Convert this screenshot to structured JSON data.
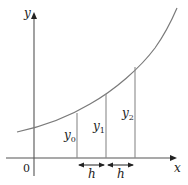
{
  "diagram": {
    "axes": {
      "x_label": "x",
      "y_label": "y",
      "origin_label": "0"
    },
    "ordinates": [
      {
        "label": "y",
        "subscript": "0"
      },
      {
        "label": "y",
        "subscript": "1"
      },
      {
        "label": "y",
        "subscript": "2"
      }
    ],
    "intervals": [
      {
        "label": "h"
      },
      {
        "label": "h"
      }
    ],
    "colors": {
      "axis": "#333333",
      "curve": "#7a7a7a",
      "ordinate": "#8a8a8a",
      "text": "#222222"
    }
  }
}
